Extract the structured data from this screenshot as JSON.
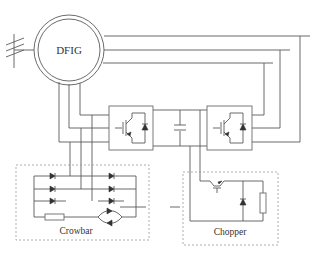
{
  "diagram": {
    "generator_label": "DFIG",
    "crowbar_label": "Crowbar",
    "chopper_label": "Chopper",
    "components": [
      "grid-connection",
      "dfig-machine",
      "rotor-side-converter",
      "dc-link-capacitor",
      "grid-side-converter",
      "crowbar-circuit",
      "chopper-circuit"
    ]
  }
}
